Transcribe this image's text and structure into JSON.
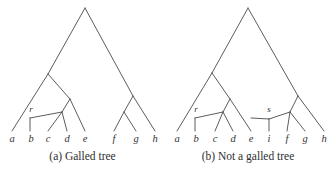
{
  "figure": {
    "width": 331,
    "height": 174,
    "background": "#ffffff",
    "line_color": "#4a4a4a",
    "text_color": "#333333"
  },
  "panels": [
    {
      "id": "a",
      "caption": "(a) Galled tree",
      "leaves": [
        {
          "label": "a",
          "x": 12,
          "y": 139
        },
        {
          "label": "b",
          "x": 31,
          "y": 139
        },
        {
          "label": "c",
          "x": 48,
          "y": 139
        },
        {
          "label": "d",
          "x": 67,
          "y": 139
        },
        {
          "label": "e",
          "x": 85,
          "y": 139
        },
        {
          "label": "f",
          "x": 114,
          "y": 139
        },
        {
          "label": "g",
          "x": 136,
          "y": 139
        },
        {
          "label": "h",
          "x": 155,
          "y": 139
        }
      ],
      "reticulation_nodes": [
        {
          "label": "r",
          "x": 31,
          "y": 112
        }
      ]
    },
    {
      "id": "b",
      "caption": "(b) Not a galled tree",
      "leaves": [
        {
          "label": "a",
          "x": 12,
          "y": 139
        },
        {
          "label": "b",
          "x": 31,
          "y": 139
        },
        {
          "label": "c",
          "x": 50,
          "y": 139
        },
        {
          "label": "d",
          "x": 68,
          "y": 139
        },
        {
          "label": "e",
          "x": 86,
          "y": 139
        },
        {
          "label": "i",
          "x": 104,
          "y": 139
        },
        {
          "label": "f",
          "x": 122,
          "y": 139
        },
        {
          "label": "g",
          "x": 140,
          "y": 139
        },
        {
          "label": "h",
          "x": 159,
          "y": 139
        }
      ],
      "reticulation_nodes": [
        {
          "label": "r",
          "x": 31,
          "y": 112
        },
        {
          "label": "s",
          "x": 104,
          "y": 112
        }
      ]
    }
  ]
}
